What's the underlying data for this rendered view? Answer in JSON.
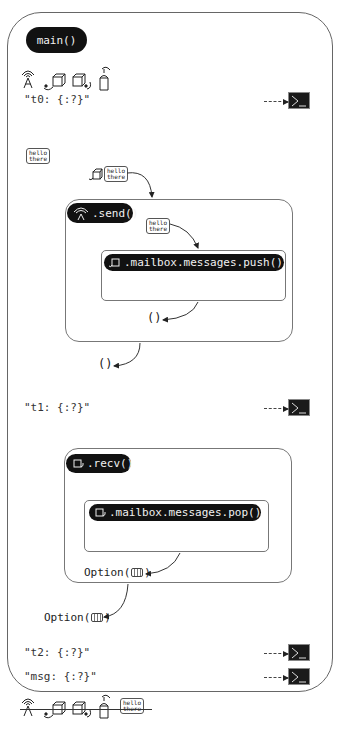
{
  "main": {
    "label": "main()"
  },
  "icons_top": [
    "antenna-icon",
    "sender-box-icon",
    "receiver-box-icon",
    "mailbox-icon"
  ],
  "prints": [
    {
      "text": "\"t0: {:?}\""
    },
    {
      "text": "\"t1: {:?}\""
    },
    {
      "text": "\"t2: {:?}\""
    },
    {
      "text": "\"msg: {:?}\""
    }
  ],
  "message": {
    "line1": "hello",
    "line2": "there"
  },
  "send": {
    "label": ".send()",
    "inner_label": ".mailbox.messages.push()",
    "inner_return": "()",
    "return": "()"
  },
  "recv": {
    "label": ".recv()",
    "inner_label": ".mailbox.messages.pop()",
    "inner_return": "Option(",
    "inner_return_close": ")",
    "return": "Option(",
    "return_close": ")"
  },
  "colors": {
    "pill": "#111111",
    "border": "#777777",
    "terminal": "#1a1a1a"
  }
}
